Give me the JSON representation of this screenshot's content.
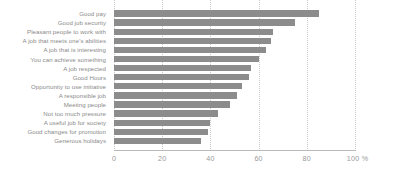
{
  "chart_data": {
    "type": "bar",
    "orientation": "horizontal",
    "title": "",
    "subtitle": "",
    "xlabel": "",
    "ylabel": "",
    "xlim": [
      0,
      100
    ],
    "xticks": [
      0,
      20,
      40,
      60,
      80,
      100
    ],
    "xtick_labels": [
      "0",
      "20",
      "40",
      "60",
      "80",
      "100"
    ],
    "x_unit": "%",
    "grid": "vertical-dotted",
    "legend": "none",
    "bar_color": "#8c8c8c",
    "label_color": "#8a8a8a",
    "tick_color": "#9a9a9a",
    "gridline_color": "#c9c9c9",
    "axis_color": "#b9b9b9",
    "categories": [
      "Good pay",
      "Good job security",
      "Pleasant people to work with",
      "A job that meets one's abilities",
      "A job that is interesting",
      "You can achieve something",
      "A job respected",
      "Good Hours",
      "Opportunity to use initiative",
      "A responsible job",
      "Meeting people",
      "Not too much pressure",
      "A useful job for society",
      "Good changes for promotion",
      "Generous holidays"
    ],
    "values": [
      85,
      75,
      66,
      65,
      63,
      60,
      57,
      56,
      53,
      51,
      48,
      43,
      40,
      39,
      36
    ]
  }
}
